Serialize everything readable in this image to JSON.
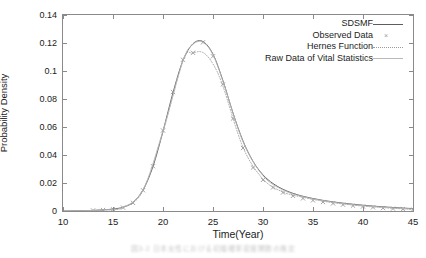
{
  "chart_data": {
    "type": "line",
    "title": "",
    "xlabel": "Time(Year)",
    "ylabel": "Probability Density",
    "xlim": [
      10,
      45
    ],
    "ylim": [
      0,
      0.14
    ],
    "xticks": [
      10,
      15,
      20,
      25,
      30,
      35,
      40,
      45
    ],
    "yticks": [
      "0",
      "0.02",
      "0.04",
      "0.06",
      "0.08",
      "0.1",
      "0.12",
      "0.14"
    ],
    "ytick_values": [
      0,
      0.02,
      0.04,
      0.06,
      0.08,
      0.1,
      0.12,
      0.14
    ],
    "grid": false,
    "legend_position": "top-right inside",
    "series": [
      {
        "name": "SDSMF",
        "style": "solid",
        "color": "#5d5d5d",
        "x": [
          10,
          11,
          12,
          13,
          14,
          15,
          16,
          17,
          18,
          19,
          20,
          21,
          22,
          23,
          24,
          25,
          26,
          27,
          28,
          29,
          30,
          31,
          32,
          33,
          34,
          35,
          36,
          37,
          38,
          39,
          40,
          41,
          42,
          43,
          44,
          45
        ],
        "values": [
          0.0,
          0.0001,
          0.0002,
          0.0004,
          0.0008,
          0.0014,
          0.0027,
          0.0062,
          0.015,
          0.0318,
          0.057,
          0.0845,
          0.1075,
          0.1195,
          0.121,
          0.112,
          0.093,
          0.07,
          0.05,
          0.0355,
          0.0258,
          0.0196,
          0.0155,
          0.0126,
          0.0105,
          0.0089,
          0.0076,
          0.0065,
          0.0056,
          0.0048,
          0.0041,
          0.0035,
          0.003,
          0.0025,
          0.0021,
          0.0017
        ]
      },
      {
        "name": "Observed Data",
        "style": "points",
        "marker": "x",
        "color": "#8d8d8d",
        "x": [
          13,
          14,
          15,
          16,
          17,
          18,
          19,
          20,
          21,
          22,
          23,
          24,
          25,
          26,
          27,
          28,
          29,
          30,
          31,
          32,
          33,
          34,
          35,
          36,
          37,
          38,
          39,
          40,
          41,
          42,
          43,
          44,
          45
        ],
        "values": [
          0.0004,
          0.0007,
          0.0012,
          0.0024,
          0.0058,
          0.0148,
          0.032,
          0.0575,
          0.085,
          0.108,
          0.113,
          0.1205,
          0.1105,
          0.0905,
          0.066,
          0.045,
          0.031,
          0.0222,
          0.0168,
          0.0132,
          0.0108,
          0.009,
          0.0076,
          0.0064,
          0.0054,
          0.0045,
          0.0038,
          0.0032,
          0.0026,
          0.0021,
          0.0017,
          0.0013,
          0.001
        ]
      },
      {
        "name": "Hernes Function",
        "style": "dotted",
        "color": "#9b9b9b",
        "x": [
          10,
          12,
          14,
          16,
          18,
          20,
          22,
          23,
          24,
          25,
          26,
          28,
          30,
          32,
          34,
          36,
          38,
          40,
          42,
          44,
          45
        ],
        "values": [
          0.0,
          0.0002,
          0.0007,
          0.0024,
          0.0145,
          0.0565,
          0.1078,
          0.1128,
          0.1132,
          0.105,
          0.089,
          0.0455,
          0.0228,
          0.0135,
          0.0098,
          0.007,
          0.005,
          0.0035,
          0.0024,
          0.0015,
          0.0012
        ]
      },
      {
        "name": "Raw Data of Vital Statistics",
        "style": "solid-light",
        "color": "#b9b9b9",
        "x": [
          10,
          12,
          14,
          16,
          18,
          20,
          22,
          23,
          24,
          25,
          26,
          28,
          30,
          32,
          34,
          36,
          38,
          40,
          42,
          44,
          45
        ],
        "values": [
          0.0,
          0.0002,
          0.0008,
          0.0026,
          0.0152,
          0.0572,
          0.1072,
          0.119,
          0.1205,
          0.1115,
          0.0925,
          0.0495,
          0.0252,
          0.015,
          0.0102,
          0.0074,
          0.0053,
          0.0038,
          0.0027,
          0.0018,
          0.0014
        ]
      }
    ]
  },
  "legend": {
    "items": [
      {
        "label": "SDSMF"
      },
      {
        "label": "Observed Data"
      },
      {
        "label": "Hernes Function"
      },
      {
        "label": "Raw Data of Vital Statistics"
      }
    ]
  },
  "caption": {
    "text": "図3-2  日本女性における初婚確率密度関数の推定"
  }
}
